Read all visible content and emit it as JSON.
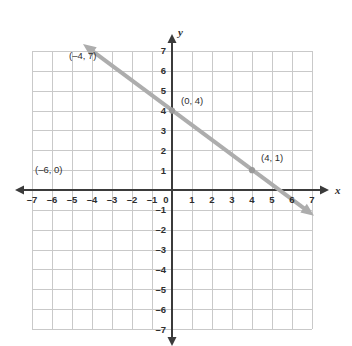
{
  "chart_data": {
    "type": "line",
    "title": "",
    "xlabel": "x",
    "ylabel": "y",
    "xlim": [
      -7,
      7
    ],
    "ylim": [
      -7,
      7
    ],
    "grid": true,
    "legend": "none",
    "x_ticks": [
      "-7",
      "-6",
      "-5",
      "-4",
      "-3",
      "-2",
      "-1",
      "0",
      "1",
      "2",
      "3",
      "4",
      "5",
      "6",
      "7"
    ],
    "y_ticks": [
      "7",
      "6",
      "5",
      "4",
      "3",
      "2",
      "1",
      "-1",
      "-2",
      "-3",
      "-4",
      "-5",
      "-6",
      "-7"
    ],
    "origin_label": "0",
    "series": [
      {
        "name": "line",
        "slope": -0.75,
        "intercept": 4,
        "equation": "y = -3/4 x + 4",
        "arrows": "both",
        "endpoints": [
          {
            "x": -4.45,
            "y": 7.35
          },
          {
            "x": 7.1,
            "y": -1.3
          }
        ],
        "points": [
          {
            "x": 0,
            "y": 4,
            "marker": true
          },
          {
            "x": 4,
            "y": 1,
            "marker": true
          }
        ]
      }
    ],
    "annotations": [
      {
        "id": "label-neg4-7",
        "text": "(–4, 7)",
        "x": -5.15,
        "y": 6.6,
        "anchor": "start"
      },
      {
        "id": "label-0-4",
        "text": "(0, 4)",
        "x": 0.45,
        "y": 4.35,
        "anchor": "start"
      },
      {
        "id": "label-4-1",
        "text": "(4, 1)",
        "x": 4.45,
        "y": 1.45,
        "anchor": "start"
      },
      {
        "id": "label-neg6-0",
        "text": "(–6, 0)",
        "x": -6.85,
        "y": 0.85,
        "anchor": "start"
      }
    ],
    "colors": {
      "grid": "#c9c9c9",
      "axis": "#3b3b3b",
      "line": "#adadad",
      "point": "#9a9a9a",
      "text": "#2e2e2e",
      "background": "#ffffff"
    }
  }
}
